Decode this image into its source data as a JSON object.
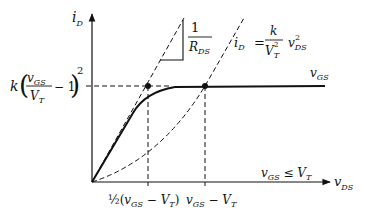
{
  "diagram": {
    "type": "mosfet-output-characteristic",
    "axes": {
      "y_label_main": "i",
      "y_label_sub": "D",
      "x_label_main": "v",
      "x_label_sub": "DS"
    },
    "saturation_level_label": {
      "k": "k",
      "num_main": "v",
      "num_sub": "GS",
      "den_main": "V",
      "den_sub": "T",
      "minus_one": "− 1",
      "exponent": "2"
    },
    "slope_annotation": {
      "numerator": "1",
      "den_main": "R",
      "den_sub": "DS"
    },
    "parabola_equation": {
      "lhs_main": "i",
      "lhs_sub": "D",
      "equals": "=",
      "num": "k",
      "den_main": "V",
      "den_sub": "T",
      "den_sup": "2",
      "var_main": "v",
      "var_sub": "DS",
      "var_sup": "2"
    },
    "curve_label": {
      "main": "v",
      "sub": "GS"
    },
    "cutoff_label": {
      "main": "v",
      "sub": "GS",
      "rest": " ≤ V",
      "rest_sub": "T"
    },
    "x_ticks": [
      {
        "prefix": "½(",
        "main": "v",
        "sub": "GS",
        "mid": " − V",
        "mid_sub": "T",
        "suffix": ")"
      },
      {
        "main": "v",
        "sub": "GS",
        "mid": " − V",
        "mid_sub": "T"
      }
    ],
    "colors": {
      "line": "#111111",
      "background": "#ffffff"
    }
  }
}
